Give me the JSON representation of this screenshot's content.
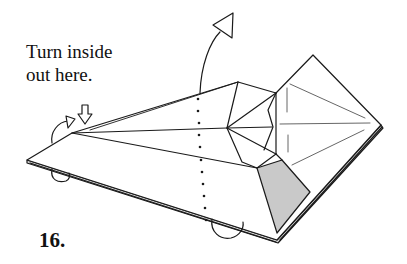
{
  "instruction": {
    "line1": "Turn inside",
    "line2": "out here."
  },
  "step_number": "16.",
  "colors": {
    "line": "#1a1a1a",
    "shade": "#c9c9c9",
    "background": "#ffffff"
  },
  "symbols": {
    "push_arrow": "hollow-down-arrow-icon",
    "turn_over_arrow": "curved-arrow-with-triangle-head-icon",
    "rotate_arrows": "loop-arrow-icon"
  }
}
